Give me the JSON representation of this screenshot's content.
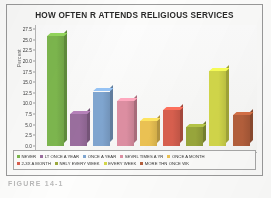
{
  "figure": {
    "caption": "FIGURE 14-1"
  },
  "chart_data": {
    "type": "bar",
    "title": "HOW OFTEN R ATTENDS RELIGIOUS SERVICES",
    "xlabel": "",
    "ylabel": "Percent",
    "ylim": [
      0,
      27.5
    ],
    "yticks": [
      "0.0",
      "2.5",
      "5.0",
      "7.5",
      "10.0",
      "12.5",
      "15.0",
      "17.5",
      "20.0",
      "22.5",
      "25.0",
      "27.5"
    ],
    "grid": false,
    "legend_position": "bottom",
    "categories": [
      "NEVER",
      "LT ONCE A YEAR",
      "ONCE A YEAR",
      "SEVRL TIMES A YR",
      "ONCE A MONTH",
      "2-3X A MONTH",
      "NRLY EVERY WEEK",
      "EVERY WEEK",
      "MORE THN ONCE WK"
    ],
    "values": [
      25.8,
      7.5,
      12.8,
      10.5,
      5.8,
      8.5,
      4.5,
      17.7,
      7.2
    ],
    "colors": [
      "#7db74e",
      "#9a6e9e",
      "#7fa5cf",
      "#dd8fa2",
      "#ecc353",
      "#d9604f",
      "#9aa83c",
      "#d3d84a",
      "#b5603c"
    ]
  }
}
